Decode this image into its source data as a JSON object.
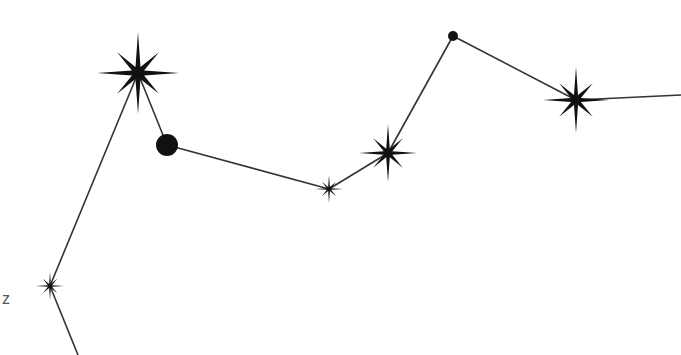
{
  "diagram": {
    "type": "constellation",
    "background": "#ffffff",
    "line_color": "#333333",
    "star_color": "#111111",
    "labels": [
      {
        "text": "z",
        "x": 2,
        "y": 291
      }
    ],
    "stars": [
      {
        "id": "s1",
        "shape": "star8",
        "x": 50,
        "y": 286,
        "r": 14
      },
      {
        "id": "s2",
        "shape": "star8",
        "x": 138,
        "y": 73,
        "r": 41
      },
      {
        "id": "s3",
        "shape": "dot",
        "x": 167,
        "y": 145,
        "r": 11
      },
      {
        "id": "s4",
        "shape": "star8",
        "x": 329,
        "y": 189,
        "r": 14
      },
      {
        "id": "s5",
        "shape": "star8",
        "x": 388,
        "y": 153,
        "r": 29
      },
      {
        "id": "s6",
        "shape": "dot",
        "x": 453,
        "y": 36,
        "r": 5
      },
      {
        "id": "s7",
        "shape": "star8",
        "x": 576,
        "y": 100,
        "r": 33
      }
    ],
    "lines": [
      {
        "x1": 78,
        "y1": 355,
        "x2": 50,
        "y2": 286
      },
      {
        "x1": 50,
        "y1": 286,
        "x2": 138,
        "y2": 73
      },
      {
        "x1": 138,
        "y1": 73,
        "x2": 167,
        "y2": 145
      },
      {
        "x1": 167,
        "y1": 145,
        "x2": 329,
        "y2": 189
      },
      {
        "x1": 329,
        "y1": 189,
        "x2": 388,
        "y2": 153
      },
      {
        "x1": 388,
        "y1": 153,
        "x2": 453,
        "y2": 36
      },
      {
        "x1": 453,
        "y1": 36,
        "x2": 576,
        "y2": 100
      },
      {
        "x1": 576,
        "y1": 100,
        "x2": 681,
        "y2": 95
      }
    ]
  }
}
